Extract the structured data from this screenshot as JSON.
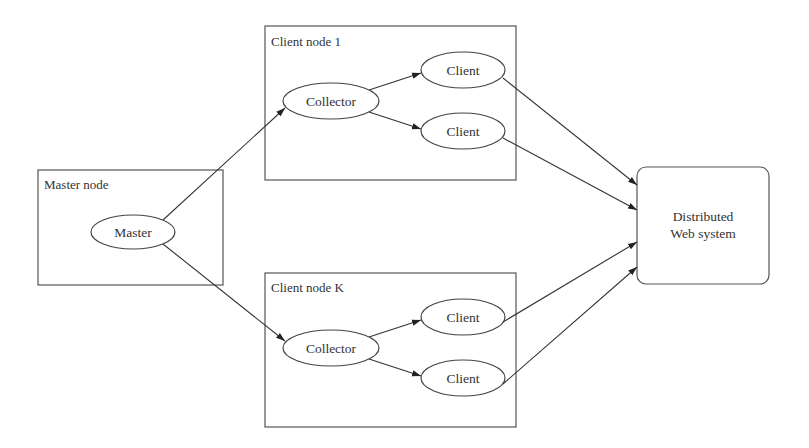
{
  "diagram": {
    "containers": {
      "master_node": {
        "label": "Master node",
        "x": 38,
        "y": 170,
        "w": 185,
        "h": 115
      },
      "client_node_1": {
        "label": "Client node 1",
        "x": 265,
        "y": 26,
        "w": 251,
        "h": 154
      },
      "client_node_k": {
        "label": "Client node K",
        "x": 265,
        "y": 273,
        "w": 251,
        "h": 154
      },
      "distributed_web_system": {
        "label_line1": "Distributed",
        "label_line2": "Web system",
        "x": 637,
        "y": 167,
        "w": 132,
        "h": 117,
        "rounded": true
      }
    },
    "nodes": {
      "master": {
        "label": "Master",
        "cx": 133,
        "cy": 232,
        "rx": 42,
        "ry": 17
      },
      "collector_1": {
        "label": "Collector",
        "cx": 331,
        "cy": 101,
        "rx": 48,
        "ry": 18
      },
      "client_1a": {
        "label": "Client",
        "cx": 463,
        "cy": 70,
        "rx": 42,
        "ry": 18
      },
      "client_1b": {
        "label": "Client",
        "cx": 463,
        "cy": 131,
        "rx": 42,
        "ry": 18
      },
      "collector_k": {
        "label": "Collector",
        "cx": 331,
        "cy": 348,
        "rx": 48,
        "ry": 18
      },
      "client_ka": {
        "label": "Client",
        "cx": 463,
        "cy": 317,
        "rx": 42,
        "ry": 18
      },
      "client_kb": {
        "label": "Client",
        "cx": 463,
        "cy": 378,
        "rx": 42,
        "ry": 18
      }
    },
    "edges": [
      {
        "from": "Master",
        "to": "Collector (Client node 1)"
      },
      {
        "from": "Master",
        "to": "Collector (Client node K)"
      },
      {
        "from": "Collector (Client node 1)",
        "to": "Client (upper)"
      },
      {
        "from": "Collector (Client node 1)",
        "to": "Client (lower)"
      },
      {
        "from": "Collector (Client node K)",
        "to": "Client (upper)"
      },
      {
        "from": "Collector (Client node K)",
        "to": "Client (lower)"
      },
      {
        "from": "Client (node 1, upper)",
        "to": "Distributed Web system"
      },
      {
        "from": "Client (node 1, lower)",
        "to": "Distributed Web system"
      },
      {
        "from": "Client (node K, upper)",
        "to": "Distributed Web system"
      },
      {
        "from": "Client (node K, lower)",
        "to": "Distributed Web system"
      }
    ]
  }
}
